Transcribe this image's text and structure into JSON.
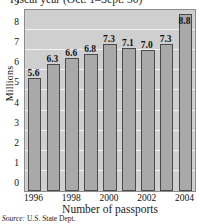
{
  "chart_data": {
    "type": "bar",
    "title": "Fiscal year (Oct. 1–Sept. 30)",
    "xlabel": "Number of passports",
    "ylabel": "Millions",
    "categories": [
      "1996",
      "1997",
      "1998",
      "1999",
      "2000",
      "2001",
      "2002",
      "2003",
      "2004"
    ],
    "values": [
      5.6,
      6.3,
      6.6,
      6.8,
      7.3,
      7.1,
      7.0,
      7.3,
      8.8
    ],
    "value_labels": [
      "5.6",
      "6.3",
      "6.6",
      "6.8",
      "7.3",
      "7.1",
      "7.0",
      "7.3",
      "8.8"
    ],
    "ylim": [
      0,
      9
    ],
    "y_ticks": [
      "0",
      "1",
      "2",
      "3",
      "4",
      "5",
      "6",
      "7",
      "8",
      "9"
    ],
    "x_tick_labels": [
      "1996",
      "1998",
      "2000",
      "2002",
      "2004"
    ],
    "x_tick_indices": [
      0,
      2,
      4,
      6,
      8
    ],
    "grid": true,
    "grid_color": "#f2f2f2",
    "legend": null,
    "plot_background": "#cfcfcf",
    "bar_color": "#a9a9a9",
    "bar_border_color": "#4a4a4a"
  },
  "source": {
    "label": "Source:",
    "text": "U.S. State Dept."
  }
}
